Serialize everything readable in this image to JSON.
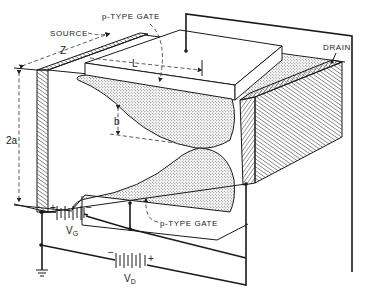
{
  "diagram": {
    "labels": {
      "source": "SOURCE",
      "drain": "DRAIN",
      "top_gate": "p-TYPE GATE",
      "bottom_gate": "p-TYPE GATE",
      "channel_width_dim": "Z",
      "gate_length_dim": "L",
      "channel_thickness_dim": "2a",
      "depletion_dim": "b",
      "gate_battery": "V",
      "gate_battery_sub": "G",
      "drain_battery": "V",
      "drain_battery_sub": "D",
      "gate_battery_plus": "+",
      "gate_battery_minus": "−",
      "drain_battery_plus": "+",
      "drain_battery_minus": "−"
    },
    "colors": {
      "line": "#1a1a1a",
      "stipple": "#9a9a9a",
      "background": "#ffffff"
    }
  }
}
